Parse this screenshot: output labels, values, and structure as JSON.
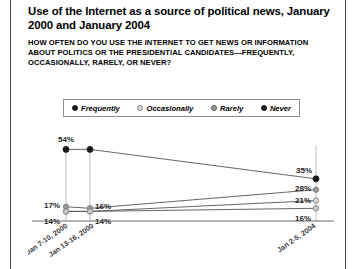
{
  "figure": {
    "title": "Use of the Internet as a source of political news, January 2000 and January 2004",
    "subtitle": "HOW OFTEN DO YOU USE THE INTERNET TO GET NEWS OR INFORMATION ABOUT POLITICS OR THE PRESIDENTIAL CANDIDATES—FREQUENTLY, OCCASIONALLY, RARELY, OR NEVER?"
  },
  "legend": {
    "position": "top",
    "items": [
      {
        "label": "Frequently",
        "marker": "filled-black-circle-icon",
        "color": "#1a1a1a"
      },
      {
        "label": "Occasionally",
        "marker": "light-gray-circle-icon",
        "color": "#d8d8d8"
      },
      {
        "label": "Rarely",
        "marker": "mid-gray-circle-icon",
        "color": "#9a9a9a"
      },
      {
        "label": "Never",
        "marker": "filled-black-circle-icon",
        "color": "#1a1a1a"
      }
    ]
  },
  "chart_data": {
    "type": "line",
    "title": "Use of the Internet as a source of political news, January 2000 and January 2004",
    "subtitle": "HOW OFTEN DO YOU USE THE INTERNET TO GET NEWS OR INFORMATION ABOUT POLITICS OR THE PRESIDENTIAL CANDIDATES—FREQUENTLY, OCCASIONALLY, RARELY, OR NEVER?",
    "xlabel": "",
    "ylabel": "",
    "ylim": [
      0,
      60
    ],
    "grid": false,
    "legend_position": "top",
    "categories": [
      "Jan 7-10, 2000",
      "Jan 13-16, 2000",
      "Jan 2-5, 2004"
    ],
    "series": [
      {
        "name": "Never",
        "values": [
          54,
          54,
          35
        ],
        "labels": [
          "54%",
          "",
          "35%"
        ],
        "color": "#1a1a1a",
        "marker": "filled-black-circle-icon"
      },
      {
        "name": "Rarely",
        "values": [
          17,
          16,
          28
        ],
        "labels": [
          "17%",
          "16%",
          "28%"
        ],
        "color": "#9a9a9a",
        "marker": "mid-gray-circle-icon"
      },
      {
        "name": "Occasionally",
        "values": [
          14,
          14,
          21
        ],
        "labels": [
          "14%",
          "14%",
          "21%"
        ],
        "color": "#d8d8d8",
        "marker": "light-gray-circle-icon"
      },
      {
        "name": "Frequently",
        "values": [
          14,
          14,
          16
        ],
        "labels": [
          "",
          "",
          "16%"
        ],
        "color": "#c8c8c8",
        "marker": "light-gray-circle-icon"
      }
    ],
    "axis_tick_labels": [
      "Jan 7-10, 2000",
      "Jan 13-16, 2000",
      "Jan 2-5, 2004"
    ]
  }
}
